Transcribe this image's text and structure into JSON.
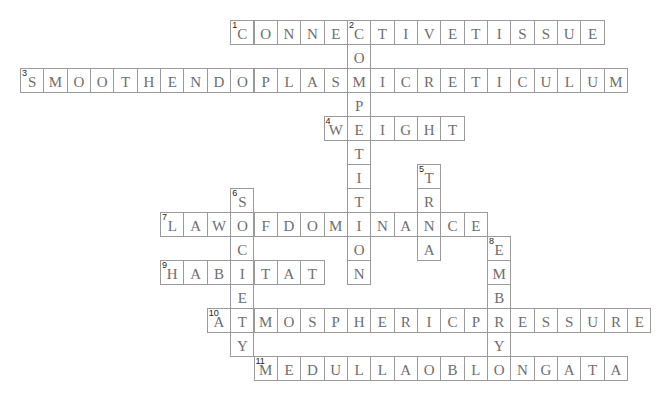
{
  "puzzle": {
    "grid": {
      "origin_x": 20,
      "origin_y": 20,
      "cell_w": 23.35,
      "cell_h": 24
    },
    "colors": {
      "border": "#9a9a9a",
      "letter": "#6e6e6e",
      "number": "#222222",
      "background": "#ffffff"
    },
    "entries": [
      {
        "number": "1",
        "direction": "across",
        "row": 0,
        "col": 9,
        "answer": "CONNECTIVETISSUE"
      },
      {
        "number": "2",
        "direction": "down",
        "row": 0,
        "col": 14,
        "answer": "COMPETITION"
      },
      {
        "number": "3",
        "direction": "across",
        "row": 2,
        "col": 0,
        "answer": "SMOOTHENDOPLASMICRETICULUM"
      },
      {
        "number": "4",
        "direction": "across",
        "row": 4,
        "col": 13,
        "answer": "WEIGHT"
      },
      {
        "number": "5",
        "direction": "down",
        "row": 6,
        "col": 17,
        "answer": "TRNA"
      },
      {
        "number": "6",
        "direction": "down",
        "row": 7,
        "col": 9,
        "answer": "SOCIETY"
      },
      {
        "number": "7",
        "direction": "across",
        "row": 8,
        "col": 6,
        "answer": "LAWOFDOMINANCE"
      },
      {
        "number": "8",
        "direction": "down",
        "row": 9,
        "col": 20,
        "answer": "EMBRYO"
      },
      {
        "number": "9",
        "direction": "across",
        "row": 10,
        "col": 6,
        "answer": "HABITAT"
      },
      {
        "number": "10",
        "direction": "across",
        "row": 12,
        "col": 8,
        "answer": "ATMOSPHERICPRESSURE"
      },
      {
        "number": "11",
        "direction": "across",
        "row": 14,
        "col": 10,
        "answer": "MEDULLAOBLONGATA"
      }
    ]
  }
}
